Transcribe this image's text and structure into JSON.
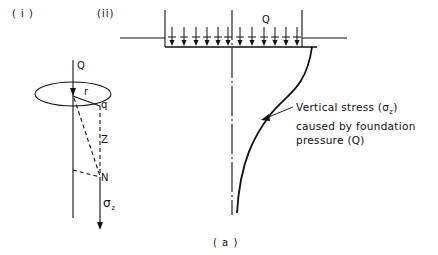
{
  "panels": {
    "left": {
      "label": "( i )",
      "load_label": "Q",
      "radius_label": "r",
      "point_q_label": "q",
      "depth_label": "Z",
      "point_n_label": "N",
      "stress_label": "σ",
      "stress_sub": "z"
    },
    "right": {
      "label": "(ii)",
      "load_label": "Q",
      "annotation_line1": "Vertical stress (σ",
      "annotation_sub": "z",
      "annotation_line1_end": ")",
      "annotation_line2": "caused by foundation",
      "annotation_line3": "pressure (Q)"
    }
  },
  "caption": "( a )",
  "colors": {
    "ink": "#111111",
    "background": "#ffffff"
  }
}
